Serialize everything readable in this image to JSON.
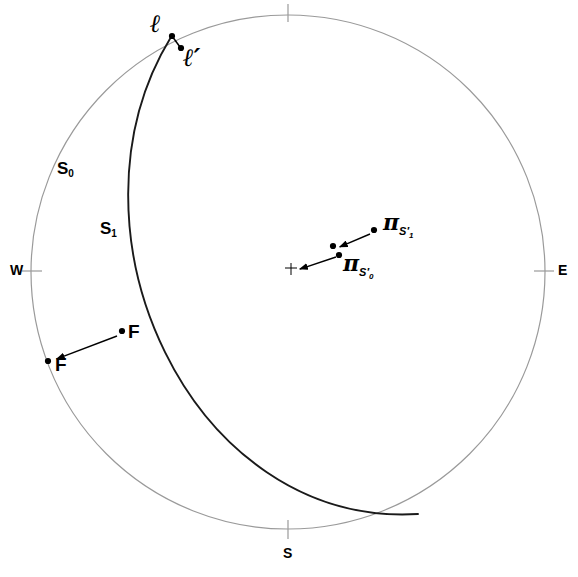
{
  "figure": {
    "type": "stereonet",
    "projection_note": "equal-area lower-hemisphere stereographic net",
    "background_color": "#ffffff",
    "primitive_color": "#9a9a9a",
    "great_circle_color": "#1a1a1a",
    "marker_color": "#000000"
  },
  "cardinals": {
    "east": "E",
    "west": "W",
    "south": "S"
  },
  "planes": [
    {
      "id": "s0",
      "label": "S",
      "subscript": "0",
      "label_x": 58,
      "label_y": 160
    },
    {
      "id": "s1",
      "label": "S",
      "subscript": "1",
      "label_x": 100,
      "label_y": 220
    }
  ],
  "lineations": [
    {
      "id": "l",
      "label": "ℓ",
      "point_x": 172,
      "point_y": 36,
      "label_x": 151,
      "label_y": 12
    },
    {
      "id": "l-prime",
      "label": "ℓ′",
      "point_x": 181,
      "point_y": 48,
      "label_x": 182,
      "label_y": 48
    }
  ],
  "fold_axes": [
    {
      "id": "f-inner",
      "label": "F",
      "point_x": 122,
      "point_y": 331,
      "label_x": 128,
      "label_y": 325
    },
    {
      "id": "f-outer",
      "label": "F",
      "point_x": 48,
      "point_y": 361,
      "label_x": 55,
      "label_y": 359
    }
  ],
  "pi_poles": [
    {
      "id": "pi-s1-prime",
      "label": "π",
      "sub": "S",
      "sub_prime": "′",
      "sub_index": "1",
      "point_x": 374,
      "point_y": 230,
      "label_x": 386,
      "label_y": 212
    },
    {
      "id": "pi-s0-prime",
      "label": "π",
      "sub": "S",
      "sub_prime": "′",
      "sub_index": "0",
      "point_x": 339,
      "point_y": 255,
      "label_x": 345,
      "label_y": 253
    }
  ],
  "center_marker": {
    "x": 292,
    "y": 269,
    "glyph": "cross"
  },
  "intermediate_points": [
    {
      "id": "pi-mid",
      "x": 333,
      "y": 246
    }
  ],
  "rotation_arrows": [
    {
      "id": "arrow-pi-1",
      "from_x": 370,
      "from_y": 234,
      "to_x": 337,
      "to_y": 248
    },
    {
      "id": "arrow-pi-0",
      "from_x": 336,
      "from_y": 257,
      "to_x": 297,
      "to_y": 270
    },
    {
      "id": "arrow-f",
      "from_x": 117,
      "from_y": 336,
      "to_x": 54,
      "to_y": 360
    }
  ],
  "connector_lines": [
    {
      "id": "l-to-lprime",
      "from_x": 172,
      "from_y": 36,
      "to_x": 180,
      "to_y": 47
    }
  ],
  "primitive_circle": {
    "cx": 288,
    "cy": 272,
    "r": 257
  },
  "great_circle_arc": {
    "start_x": 171,
    "start_y": 37,
    "end_x": 418,
    "end_y": 514,
    "control_1_x": 54,
    "control_1_y": 228,
    "control_2_x": 190,
    "control_2_y": 528
  },
  "tick_marks": [
    {
      "id": "tick-north",
      "x1": 288,
      "y1": 4,
      "x2": 288,
      "y2": 22
    },
    {
      "id": "tick-south",
      "x1": 288,
      "y1": 520,
      "x2": 288,
      "y2": 539
    },
    {
      "id": "tick-west",
      "x1": 22,
      "y1": 271,
      "x2": 42,
      "y2": 271
    },
    {
      "id": "tick-east",
      "x1": 534,
      "y1": 271,
      "x2": 554,
      "y2": 271
    }
  ]
}
